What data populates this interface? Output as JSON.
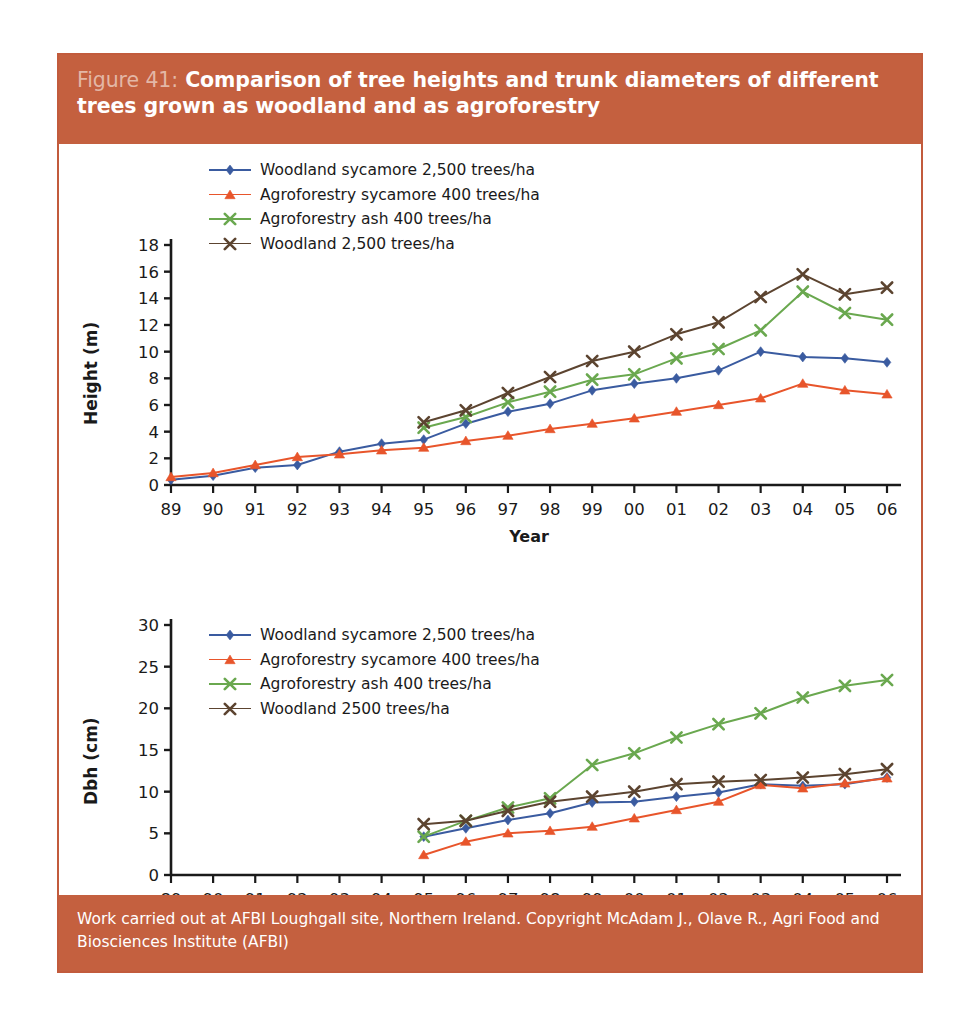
{
  "figure": {
    "number": "Figure 41:",
    "title": "Comparison of tree heights and trunk diameters of different trees grown as woodland and as agroforestry",
    "footer": "Work carried out at AFBI Loughgall site, Northern Ireland. Copyright McAdam J., Olave R., Agri Food and Biosciences Institute (AFBI)",
    "band_color": "#c4603f",
    "border_color": "#c25b3c"
  },
  "colors": {
    "woodland_sycamore": "#3a5ba0",
    "agroforestry_sycamore": "#e8552b",
    "agroforestry_ash": "#6aa84f",
    "woodland": "#5c4430"
  },
  "chart_data": [
    {
      "type": "line",
      "id": "height",
      "title": "",
      "xlabel": "Year",
      "ylabel": "Height (m)",
      "ylim": [
        0,
        18
      ],
      "yticks": [
        0,
        2,
        4,
        6,
        8,
        10,
        12,
        14,
        16,
        18
      ],
      "grid": false,
      "legend_position": "top-left",
      "categories": [
        "89",
        "90",
        "91",
        "92",
        "93",
        "94",
        "95",
        "96",
        "97",
        "98",
        "99",
        "00",
        "01",
        "02",
        "03",
        "04",
        "05",
        "06"
      ],
      "series": [
        {
          "name": "Woodland sycamore 2,500 trees/ha",
          "color": "#3a5ba0",
          "marker": "diamond",
          "values": [
            0.4,
            0.7,
            1.3,
            1.5,
            2.5,
            3.1,
            3.4,
            4.6,
            5.5,
            6.1,
            7.1,
            7.6,
            8.0,
            8.6,
            10.0,
            9.6,
            9.5,
            9.2
          ]
        },
        {
          "name": "Agroforestry sycamore 400 trees/ha",
          "color": "#e8552b",
          "marker": "triangle",
          "values": [
            0.6,
            0.9,
            1.5,
            2.1,
            2.3,
            2.6,
            2.8,
            3.3,
            3.7,
            4.2,
            4.6,
            5.0,
            5.5,
            6.0,
            6.5,
            7.6,
            7.1,
            6.8
          ]
        },
        {
          "name": "Agroforestry ash 400 trees/ha",
          "color": "#6aa84f",
          "marker": "cross",
          "values": [
            null,
            null,
            null,
            null,
            null,
            null,
            4.3,
            5.1,
            6.2,
            7.0,
            7.9,
            8.3,
            9.5,
            10.2,
            11.6,
            14.5,
            12.9,
            12.4
          ]
        },
        {
          "name": "Woodland 2,500 trees/ha",
          "color": "#5c4430",
          "marker": "cross",
          "values": [
            null,
            null,
            null,
            null,
            null,
            null,
            4.7,
            5.6,
            6.9,
            8.1,
            9.3,
            10.0,
            11.3,
            12.2,
            14.1,
            15.8,
            14.3,
            14.8
          ]
        }
      ]
    },
    {
      "type": "line",
      "id": "dbh",
      "title": "",
      "xlabel": "Year",
      "ylabel": "Dbh (cm)",
      "ylim": [
        0,
        30
      ],
      "yticks": [
        0,
        5,
        10,
        15,
        20,
        25,
        30
      ],
      "grid": false,
      "legend_position": "top-left",
      "categories": [
        "89",
        "90",
        "91",
        "92",
        "93",
        "94",
        "95",
        "96",
        "97",
        "98",
        "99",
        "00",
        "01",
        "02",
        "03",
        "04",
        "05",
        "06"
      ],
      "series": [
        {
          "name": "Woodland sycamore 2,500 trees/ha",
          "color": "#3a5ba0",
          "marker": "diamond",
          "values": [
            null,
            null,
            null,
            null,
            null,
            null,
            4.6,
            5.6,
            6.6,
            7.4,
            8.7,
            8.8,
            9.4,
            9.9,
            10.9,
            10.7,
            10.9,
            11.7
          ]
        },
        {
          "name": "Agroforestry sycamore 400 trees/ha",
          "color": "#e8552b",
          "marker": "triangle",
          "values": [
            null,
            null,
            null,
            null,
            null,
            null,
            2.4,
            4.0,
            5.0,
            5.3,
            5.8,
            6.8,
            7.8,
            8.8,
            10.8,
            10.4,
            11.0,
            11.6
          ]
        },
        {
          "name": "Agroforestry ash 400 trees/ha",
          "color": "#6aa84f",
          "marker": "cross",
          "values": [
            null,
            null,
            null,
            null,
            null,
            null,
            4.6,
            6.5,
            8.1,
            9.2,
            13.2,
            14.6,
            16.5,
            18.1,
            19.4,
            21.3,
            22.7,
            23.4
          ]
        },
        {
          "name": "Woodland 2500 trees/ha",
          "color": "#5c4430",
          "marker": "cross",
          "values": [
            null,
            null,
            null,
            null,
            null,
            null,
            6.1,
            6.5,
            7.7,
            8.8,
            9.4,
            10.0,
            10.9,
            11.2,
            11.4,
            11.7,
            12.1,
            12.7
          ]
        }
      ]
    }
  ]
}
